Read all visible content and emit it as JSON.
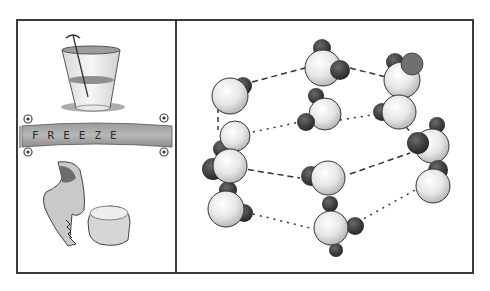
{
  "illustration": {
    "left_panel": {
      "top_scene": "glass-of-water-with-stirrer",
      "banner": {
        "label": "FREEZE"
      },
      "bottom_scene": "cracked-glass-and-ice-block"
    },
    "right_panel": {
      "scene": "ice-crystal-lattice",
      "molecule_count": 9,
      "bond_styles": [
        "dashed",
        "dotted"
      ]
    },
    "colors": {
      "frame": "#3a3a3a",
      "oxygen_fill": "#ececec",
      "hydrogen_fill": "#3f3f3f",
      "banner_fill": "#a9a9a9",
      "background": "#ffffff"
    }
  }
}
